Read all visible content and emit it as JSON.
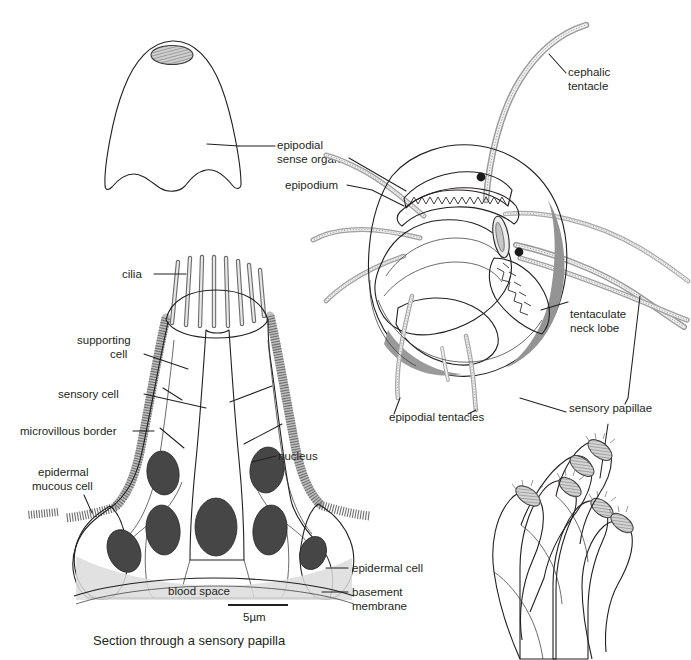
{
  "figure": {
    "caption": "Section through a sensory papilla",
    "scale_bar_label": "5µm"
  },
  "labels": {
    "epipodial_sense_organ": "epipodial\nsense organ",
    "epipodial_sense_organ_l1": "epipodial",
    "epipodial_sense_organ_l2": "sense organ",
    "epipodium": "epipodium",
    "cephalic_tentacle_l1": "cephalic",
    "cephalic_tentacle_l2": "tentacle",
    "tentaculate_neck_lobe_l1": "tentaculate",
    "tentaculate_neck_lobe_l2": "neck lobe",
    "epipodial_tentacles": "epipodial tentacles",
    "sensory_papillae": "sensory papillae",
    "cilia": "cilia",
    "supporting_cell_l1": "supporting",
    "supporting_cell_l2": "cell",
    "sensory_cell": "sensory cell",
    "microvillous_border": "microvillous border",
    "epidermal_mucous_cell_l1": "epidermal",
    "epidermal_mucous_cell_l2": "mucous cell",
    "nucleus": "nucleus",
    "epidermal_cell": "epidermal cell",
    "basement_membrane_l1": "basement",
    "basement_membrane_l2": "membrane",
    "blood_space": "blood space"
  },
  "colors": {
    "ink": "#231f20",
    "cell_fill": "#ebebeb",
    "nucleus_fill": "#464646",
    "body_light": "#d2d2d2",
    "body_mid": "#b4b4b4",
    "body_dark": "#8a8a8a",
    "body_darker": "#6e6e6e",
    "papilla_fill": "#e6e6e6",
    "background": "#ffffff"
  }
}
